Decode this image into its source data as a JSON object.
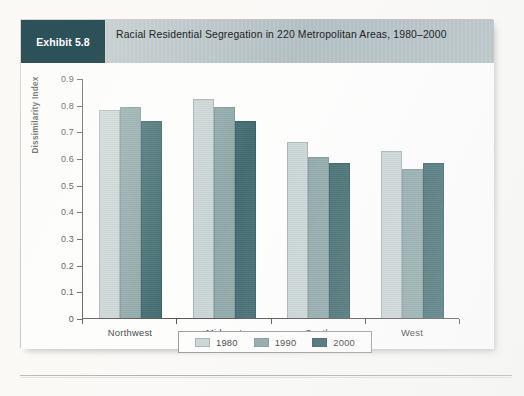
{
  "exhibit": {
    "tag_label": "Exhibit 5.8",
    "title": "Racial Residential Segregation in 220 Metropolitan Areas, 1980–2000",
    "tag_bg": "#2d5158",
    "header_bg": "#a8b8bd"
  },
  "axes": {
    "ylabel": "Dissimilarity Index",
    "ytick_labels": [
      "0.9",
      "0.8",
      "0.7",
      "0.6",
      "0.5",
      "0.4",
      "0.3",
      "0.2",
      "0.1",
      "0"
    ],
    "xtick_labels": [
      "Northwest",
      "Midwest",
      "South",
      "West"
    ]
  },
  "legend": {
    "items": [
      {
        "label": "1980",
        "color": "#c3d1d2"
      },
      {
        "label": "1990",
        "color": "#7d9b9d"
      },
      {
        "label": "2000",
        "color": "#1f5359"
      }
    ]
  },
  "chart_data": {
    "type": "bar",
    "title": "Racial Residential Segregation in 220 Metropolitan Areas, 1980–2000",
    "xlabel": "",
    "ylabel": "Dissimilarity Index",
    "ylim": [
      0,
      0.9
    ],
    "ytick_step": 0.1,
    "grid": false,
    "legend_position": "bottom",
    "categories": [
      "Northwest",
      "Midwest",
      "South",
      "West"
    ],
    "series": [
      {
        "name": "1980",
        "color": "#c3d1d2",
        "values": [
          0.78,
          0.82,
          0.66,
          0.625
        ]
      },
      {
        "name": "1990",
        "color": "#7d9b9d",
        "values": [
          0.79,
          0.79,
          0.605,
          0.56
        ]
      },
      {
        "name": "2000",
        "color": "#1f5359",
        "values": [
          0.74,
          0.74,
          0.58,
          0.58
        ]
      }
    ]
  }
}
